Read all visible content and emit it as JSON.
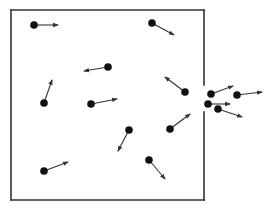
{
  "diagram": {
    "colors": {
      "wall": "#333333",
      "particle": "#111111",
      "arrow": "#333333",
      "background": "#ffffff"
    },
    "box": {
      "left": 11,
      "top": 10,
      "right": 204,
      "bottom": 200,
      "opening": {
        "wall": "right",
        "y_start": 85,
        "y_end": 112
      }
    },
    "particles": [
      {
        "id": "p1",
        "x": 34,
        "y": 25,
        "vx_tip": 58,
        "vy_tip": 25,
        "inside": true
      },
      {
        "id": "p2",
        "x": 152,
        "y": 23,
        "vx_tip": 174,
        "vy_tip": 35,
        "inside": true
      },
      {
        "id": "p3",
        "x": 108,
        "y": 67,
        "vx_tip": 84,
        "vy_tip": 71,
        "inside": true
      },
      {
        "id": "p4",
        "x": 44,
        "y": 103,
        "vx_tip": 52,
        "vy_tip": 80,
        "inside": true
      },
      {
        "id": "p5",
        "x": 91,
        "y": 104,
        "vx_tip": 117,
        "vy_tip": 99,
        "inside": true
      },
      {
        "id": "p6",
        "x": 185,
        "y": 92,
        "vx_tip": 165,
        "vy_tip": 77,
        "inside": true
      },
      {
        "id": "p7",
        "x": 170,
        "y": 129,
        "vx_tip": 190,
        "vy_tip": 114,
        "inside": true
      },
      {
        "id": "p8",
        "x": 129,
        "y": 130,
        "vx_tip": 118,
        "vy_tip": 151,
        "inside": true
      },
      {
        "id": "p9",
        "x": 149,
        "y": 160,
        "vx_tip": 165,
        "vy_tip": 179,
        "inside": true
      },
      {
        "id": "p10",
        "x": 44,
        "y": 171,
        "vx_tip": 68,
        "vy_tip": 162,
        "inside": true
      },
      {
        "id": "p11",
        "x": 211,
        "y": 94,
        "vx_tip": 233,
        "vy_tip": 86,
        "inside": false
      },
      {
        "id": "p12",
        "x": 237,
        "y": 95,
        "vx_tip": 262,
        "vy_tip": 92,
        "inside": false
      },
      {
        "id": "p13",
        "x": 208,
        "y": 104,
        "vx_tip": 230,
        "vy_tip": 104,
        "inside": false
      },
      {
        "id": "p14",
        "x": 218,
        "y": 109,
        "vx_tip": 242,
        "vy_tip": 117,
        "inside": false
      }
    ]
  }
}
